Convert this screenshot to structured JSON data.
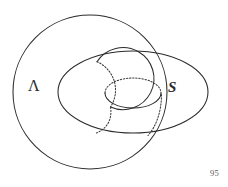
{
  "figure": {
    "type": "topological-diagram",
    "background_color": "#ffffff",
    "stroke_color": "#2b2b2b",
    "labels": {
      "left": "Λ",
      "right": "S"
    },
    "page_number": "95",
    "shapes": [
      {
        "name": "lambda-circle",
        "kind": "circle",
        "style": "solid",
        "cx": 90,
        "cy": 92,
        "r": 77
      },
      {
        "name": "torus-outer-ellipse",
        "kind": "ellipse",
        "style": "solid",
        "cx": 133,
        "cy": 92,
        "rx": 75,
        "ry": 41
      },
      {
        "name": "torus-left-tube-circle",
        "kind": "circle",
        "style": "solid-and-hidden",
        "cx": 85,
        "cy": 90,
        "r": 31
      },
      {
        "name": "torus-hole-ellipse",
        "kind": "ellipse",
        "style": "hidden-top-solid-bottom",
        "cx": 133,
        "cy": 93,
        "rx": 28,
        "ry": 15
      }
    ]
  }
}
